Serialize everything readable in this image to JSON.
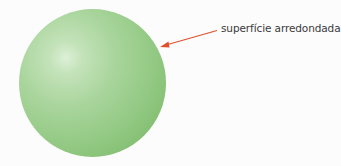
{
  "diagram": {
    "annotation": {
      "label": "superfície arredondada",
      "arrow_color": "#e0502a"
    },
    "colors": {
      "sphere_highlight": "#dcf0d6",
      "sphere_mid": "#a9d59c",
      "sphere_shadow": "#76b664",
      "label_text": "#3a3a3a"
    }
  }
}
